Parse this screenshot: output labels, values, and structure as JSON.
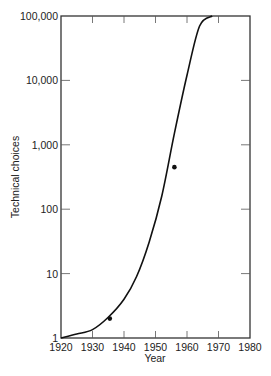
{
  "chart_data": {
    "type": "line",
    "title": "",
    "xlabel": "Year",
    "ylabel": "Technical choices",
    "xlim": [
      1920,
      1980
    ],
    "ylim": [
      1,
      100000
    ],
    "yscale": "log",
    "grid": false,
    "legend": null,
    "x_ticks": [
      1920,
      1930,
      1940,
      1950,
      1960,
      1970,
      1980
    ],
    "x_tick_labels": [
      "1920",
      "1930",
      "1940",
      "1950",
      "1960",
      "1970",
      "1980"
    ],
    "y_ticks": [
      1,
      10,
      100,
      1000,
      10000,
      100000
    ],
    "y_tick_labels": [
      "1",
      "10",
      "100",
      "1,000",
      "10,000",
      "100,000"
    ],
    "series": [
      {
        "name": "fitted curve",
        "style": "line",
        "x": [
          1920,
          1925,
          1930,
          1935,
          1940,
          1944,
          1948,
          1952,
          1956,
          1960,
          1964,
          1968
        ],
        "y": [
          1,
          1.15,
          1.35,
          2.1,
          4,
          9,
          31,
          160,
          1500,
          12000,
          70000,
          100000
        ]
      },
      {
        "name": "observed points",
        "style": "scatter",
        "x": [
          1935.5,
          1956
        ],
        "y": [
          2,
          450
        ]
      }
    ]
  }
}
